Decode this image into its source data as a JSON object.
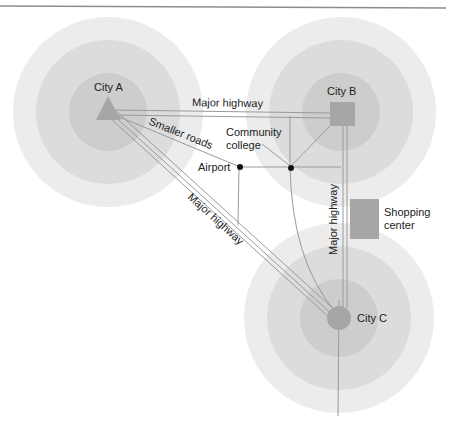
{
  "diagram": {
    "type": "urban-region-map",
    "cities": [
      {
        "id": "A",
        "label": "City A",
        "shape": "triangle",
        "cx": 108,
        "cy": 112
      },
      {
        "id": "B",
        "label": "City B",
        "shape": "square",
        "cx": 341,
        "cy": 114
      },
      {
        "id": "C",
        "label": "City C",
        "shape": "circle",
        "cx": 339,
        "cy": 318
      }
    ],
    "labels": {
      "highway_ab": "Major highway",
      "highway_ac": "Major highway",
      "highway_bc": "Major highway",
      "smaller_roads": "Smaller roads",
      "community_college_line1": "Community",
      "community_college_line2": "college",
      "airport": "Airport",
      "shopping_line1": "Shopping",
      "shopping_line2": "center"
    },
    "colors": {
      "ring_outer": "#ececec",
      "ring_middle": "#dcdcdc",
      "ring_inner": "#cdcdcd",
      "city_marker": "#a6a6a6",
      "road": "#9a9a9a",
      "node": "#111111",
      "top_rule": "#8c8c8c"
    }
  }
}
